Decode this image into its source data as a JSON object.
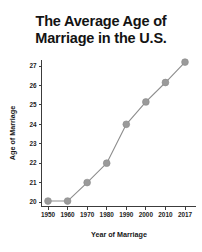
{
  "chart_data": {
    "type": "line",
    "title": "The Average Age of\nMarriage in the U.S.",
    "title_line1": "The Average Age of",
    "title_line2": "Marriage in the U.S.",
    "xlabel": "Year of Marriage",
    "ylabel": "Age of Marriage",
    "categories": [
      "1950",
      "1960",
      "1970",
      "1980",
      "1990",
      "2000",
      "2010",
      "2017"
    ],
    "x": [
      1950,
      1960,
      1970,
      1980,
      1990,
      2000,
      2010,
      2017
    ],
    "values": [
      20.05,
      20.05,
      21.0,
      22.0,
      24.0,
      25.15,
      26.15,
      27.2
    ],
    "series": [
      {
        "name": "Average age of marriage",
        "values": [
          20.05,
          20.05,
          21.0,
          22.0,
          24.0,
          25.15,
          26.15,
          27.2
        ]
      }
    ],
    "xtick_labels": [
      "1950",
      "1960",
      "1970",
      "1980",
      "1990",
      "2000",
      "2010",
      "2017"
    ],
    "ytick_labels": [
      "20",
      "21",
      "22",
      "23",
      "24",
      "25",
      "26",
      "27"
    ],
    "ytick_values": [
      20,
      21,
      22,
      23,
      24,
      25,
      26,
      27
    ],
    "ylim": [
      19.6,
      27.6
    ],
    "grid": false,
    "legend": false,
    "marker": "circle",
    "line_color": "#8d8d8d",
    "marker_color": "#9a9a9a",
    "axis_color": "#3c3c3c",
    "text_color": "#1a1a1a",
    "background_color": "#ffffff"
  }
}
